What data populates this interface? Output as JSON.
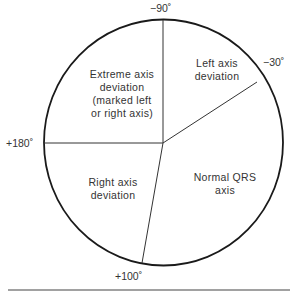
{
  "diagram": {
    "type": "qrs-axis-circle",
    "angles": {
      "top": "−90˚",
      "upper_right": "−30˚",
      "left": "+180˚",
      "bottom": "+100˚"
    },
    "regions": {
      "extreme": [
        "Extreme axis",
        "deviation",
        "(marked left",
        "or right axis)"
      ],
      "left_axis": [
        "Left axis",
        "deviation"
      ],
      "right_axis": [
        "Right axis",
        "deviation"
      ],
      "normal": [
        "Normal QRS",
        "axis"
      ]
    },
    "colors": {
      "stroke": "#1a1a1a",
      "text": "#333333"
    }
  }
}
